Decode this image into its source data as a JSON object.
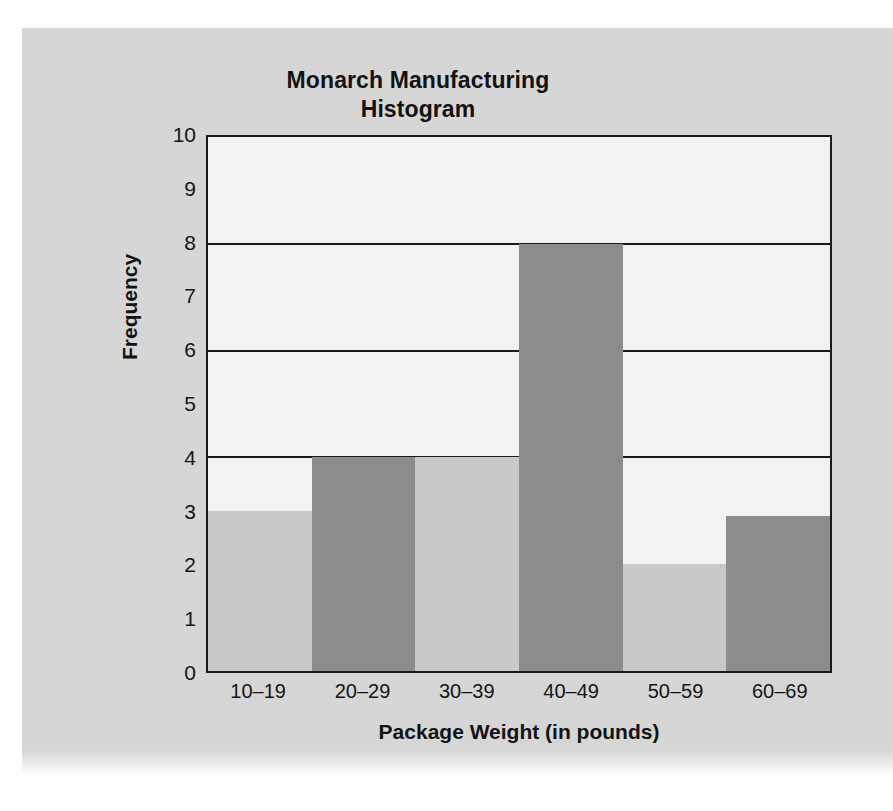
{
  "figure": {
    "background_color": "#d6d6d6",
    "plot_background_color": "#f2f2f2",
    "axis_color": "#1a1a1a"
  },
  "chart_data": {
    "type": "bar",
    "title": "Monarch Manufacturing Histogram",
    "title_lines": [
      "Monarch Manufacturing",
      "Histogram"
    ],
    "xlabel": "Package Weight (in pounds)",
    "ylabel": "Frequency",
    "categories": [
      "10–19",
      "20–29",
      "30–39",
      "40–49",
      "50–59",
      "60–69"
    ],
    "values": [
      3,
      4,
      4,
      8,
      2,
      2.9
    ],
    "bar_colors": [
      "#c9c9c9",
      "#8c8c8c",
      "#c9c9c9",
      "#8c8c8c",
      "#c9c9c9",
      "#8c8c8c"
    ],
    "ylim": [
      0,
      10
    ],
    "yticks": [
      0,
      1,
      2,
      3,
      4,
      5,
      6,
      7,
      8,
      9,
      10
    ],
    "ytick_labels": [
      "0",
      "1",
      "2",
      "3",
      "4",
      "5",
      "6",
      "7",
      "8",
      "9",
      "10"
    ],
    "gridlines": [
      4,
      6,
      8
    ],
    "grid": true,
    "legend": null,
    "legend_position": "none"
  }
}
